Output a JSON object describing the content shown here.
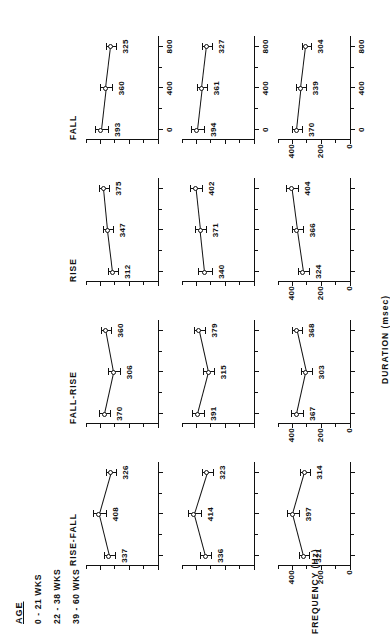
{
  "figure": {
    "age_legend_title": "AGE",
    "age_groups": [
      "0 - 21 WKS",
      "22 - 38 WKS",
      "39 - 60 WKS"
    ],
    "column_titles": [
      "RISE-FALL",
      "FALL-RISE",
      "RISE",
      "FALL"
    ],
    "x_axis_label": "DURATION   (msec)",
    "y_axis_label": "FREQUENCY  (Hz)"
  },
  "chart_data": {
    "type": "line",
    "title": "",
    "xlabel": "DURATION   (msec)",
    "ylabel": "FREQUENCY  (Hz)",
    "xlim": [
      -100,
      900
    ],
    "ylim": [
      0,
      500
    ],
    "xticks": [
      0,
      400,
      800
    ],
    "xticklabels": [
      "0",
      "400",
      "800"
    ],
    "yticks": [
      0,
      200,
      400
    ],
    "yticklabels": [
      "0",
      "200",
      "400"
    ],
    "grid": false,
    "legend": "none",
    "x": [
      0,
      400,
      800
    ],
    "panels": [
      {
        "contour": "RISE-FALL",
        "rows": [
          {
            "age": "0 - 21 WKS",
            "values": [
              337,
              408,
              326
            ],
            "errors": [
              38,
              44,
              36
            ]
          },
          {
            "age": "22 - 38 WKS",
            "values": [
              336,
              414,
              323
            ],
            "errors": [
              40,
              46,
              38
            ]
          },
          {
            "age": "39 - 60 WKS",
            "values": [
              321,
              397,
              314
            ],
            "errors": [
              36,
              42,
              36
            ]
          }
        ]
      },
      {
        "contour": "FALL-RISE",
        "rows": [
          {
            "age": "0 - 21 WKS",
            "values": [
              370,
              306,
              360
            ],
            "errors": [
              38,
              40,
              34
            ]
          },
          {
            "age": "22 - 38 WKS",
            "values": [
              391,
              315,
              379
            ],
            "errors": [
              42,
              40,
              36
            ]
          },
          {
            "age": "39 - 60 WKS",
            "values": [
              367,
              303,
              368
            ],
            "errors": [
              40,
              36,
              36
            ]
          }
        ]
      },
      {
        "contour": "RISE",
        "rows": [
          {
            "age": "0 - 21 WKS",
            "values": [
              312,
              347,
              375
            ],
            "errors": [
              36,
              34,
              38
            ]
          },
          {
            "age": "22 - 38 WKS",
            "values": [
              340,
              371,
              402
            ],
            "errors": [
              46,
              40,
              40
            ]
          },
          {
            "age": "39 - 60 WKS",
            "values": [
              324,
              366,
              404
            ],
            "errors": [
              36,
              38,
              42
            ]
          }
        ]
      },
      {
        "contour": "FALL",
        "rows": [
          {
            "age": "0 - 21 WKS",
            "values": [
              393,
              360,
              325
            ],
            "errors": [
              44,
              42,
              34
            ]
          },
          {
            "age": "22 - 38 WKS",
            "values": [
              394,
              361,
              327
            ],
            "errors": [
              44,
              38,
              36
            ]
          },
          {
            "age": "39 - 60 WKS",
            "values": [
              370,
              339,
              304
            ],
            "errors": [
              34,
              34,
              32
            ]
          }
        ]
      }
    ]
  }
}
